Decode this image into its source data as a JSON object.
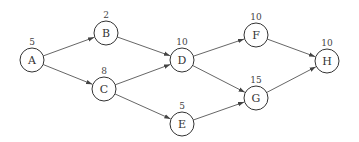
{
  "diagram": {
    "type": "activity-network",
    "nodes": [
      {
        "id": "A",
        "label": "A",
        "value": "5",
        "x": 32,
        "y": 60
      },
      {
        "id": "B",
        "label": "B",
        "value": "2",
        "x": 106,
        "y": 33
      },
      {
        "id": "C",
        "label": "C",
        "value": "8",
        "x": 104,
        "y": 89
      },
      {
        "id": "D",
        "label": "D",
        "value": "10",
        "x": 182,
        "y": 60
      },
      {
        "id": "E",
        "label": "E",
        "value": "5",
        "x": 182,
        "y": 124
      },
      {
        "id": "F",
        "label": "F",
        "value": "10",
        "x": 256,
        "y": 35
      },
      {
        "id": "G",
        "label": "G",
        "value": "15",
        "x": 256,
        "y": 98
      },
      {
        "id": "H",
        "label": "H",
        "value": "10",
        "x": 327,
        "y": 61
      }
    ],
    "edges": [
      {
        "from": "A",
        "to": "B"
      },
      {
        "from": "A",
        "to": "C"
      },
      {
        "from": "B",
        "to": "D"
      },
      {
        "from": "C",
        "to": "D"
      },
      {
        "from": "C",
        "to": "E"
      },
      {
        "from": "D",
        "to": "F"
      },
      {
        "from": "D",
        "to": "G"
      },
      {
        "from": "E",
        "to": "G"
      },
      {
        "from": "F",
        "to": "H"
      },
      {
        "from": "G",
        "to": "H"
      }
    ],
    "node_radius": 12,
    "colors": {
      "stroke": "#333333",
      "edge": "#555555",
      "background": "#ffffff"
    }
  }
}
